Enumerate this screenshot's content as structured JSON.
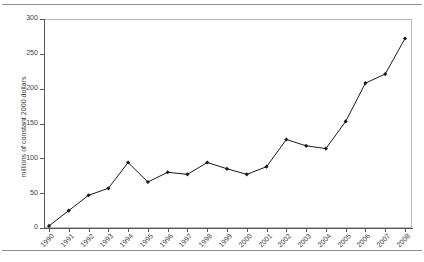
{
  "figure": {
    "top_rule": "",
    "bottom_rule": ""
  },
  "chart_data": {
    "type": "line",
    "title": "",
    "xlabel": "",
    "ylabel": "millions of constant 2000 dollars",
    "categories": [
      "1990",
      "1991",
      "1992",
      "1993",
      "1994",
      "1995",
      "1996",
      "1997",
      "1998",
      "1999",
      "2000",
      "2001",
      "2002",
      "2003",
      "2004",
      "2005",
      "2006",
      "2007",
      "2008"
    ],
    "values": [
      3,
      25,
      47,
      57,
      94,
      66,
      80,
      77,
      94,
      85,
      77,
      88,
      127,
      118,
      114,
      153,
      208,
      221,
      272
    ],
    "ylim": [
      0,
      300
    ],
    "yticks": [
      0,
      50,
      100,
      150,
      200,
      250,
      300
    ],
    "ytick_labels": [
      "0",
      "50",
      "100",
      "150",
      "200",
      "250",
      "300"
    ],
    "grid": false,
    "legend": "none",
    "marker": "filled-diamond",
    "line_color": "#1a1a1a",
    "marker_color": "#1a1a1a"
  }
}
